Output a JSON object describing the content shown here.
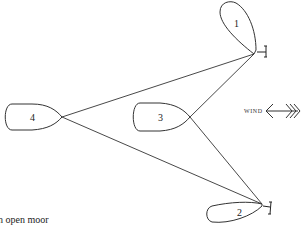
{
  "diagram": {
    "boats": [
      {
        "id": "boat-1",
        "label": "1"
      },
      {
        "id": "boat-2",
        "label": "2"
      },
      {
        "id": "boat-3",
        "label": "3"
      },
      {
        "id": "boat-4",
        "label": "4"
      }
    ],
    "wind": {
      "label": "WIND",
      "icon": "wind-arrow-icon"
    },
    "anchors": [
      {
        "icon": "anchor-icon"
      },
      {
        "icon": "anchor-icon"
      }
    ],
    "caption": "n open moor"
  }
}
